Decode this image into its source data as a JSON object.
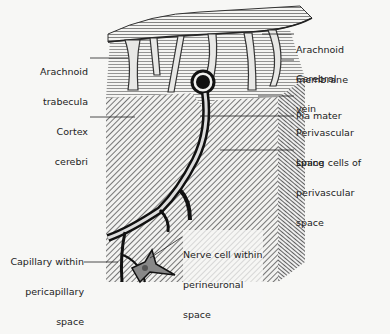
{
  "diagram": {
    "labels": {
      "arachnoid_trabecula": [
        "Arachnoid",
        "trabecula"
      ],
      "cortex_cerebri": [
        "Cortex",
        "cerebri"
      ],
      "arachnoid_membrane": [
        "Arachnoid",
        "membrane"
      ],
      "cerebral_vein": [
        "Cerebral",
        "vein"
      ],
      "pia_mater": [
        "Pia mater"
      ],
      "perivascular_space": [
        "Perivascular",
        "space"
      ],
      "lining_cells": [
        "Lining cells of",
        "perivascular",
        "space"
      ],
      "capillary": [
        "Capillary within",
        "pericapillary",
        "space"
      ],
      "nerve_cell": [
        "Nerve cell within",
        "perineuronal",
        "space"
      ]
    },
    "colors": {
      "ink": "#222222",
      "background": "#f7f7f5",
      "shade": "#555555"
    }
  }
}
